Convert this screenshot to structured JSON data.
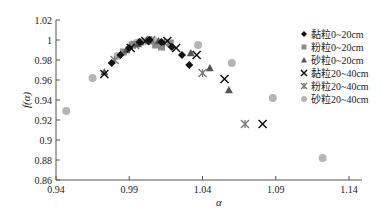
{
  "chart_data": {
    "type": "scatter",
    "title": "",
    "xlabel": "α",
    "ylabel": "f(α)",
    "xlim": [
      0.94,
      1.14
    ],
    "ylim": [
      0.86,
      1.02
    ],
    "xticks": [
      "0.94",
      "0.99",
      "1.04",
      "1.09",
      "1.14"
    ],
    "yticks": [
      "1.02",
      "1",
      "0.98",
      "0.96",
      "0.94",
      "0.92",
      "0.9",
      "0.88",
      "0.86"
    ],
    "grid": false,
    "legend_position": "right",
    "series": [
      {
        "name": "黏粒0~20cm",
        "marker": "diamond",
        "color": "#111111",
        "points": [
          [
            0.978,
            0.977
          ],
          [
            0.984,
            0.985
          ],
          [
            0.99,
            0.992
          ],
          [
            0.997,
            0.998
          ],
          [
            1.004,
            1.0
          ],
          [
            1.012,
            0.998
          ],
          [
            1.019,
            0.993
          ],
          [
            1.026,
            0.985
          ],
          [
            1.031,
            0.975
          ]
        ]
      },
      {
        "name": "粉粒0~20cm",
        "marker": "square",
        "color": "#8c8c8c",
        "points": [
          [
            0.986,
            0.988
          ],
          [
            0.992,
            0.995
          ],
          [
            0.998,
            0.998
          ],
          [
            1.003,
            0.999
          ],
          [
            1.008,
            0.995
          ],
          [
            1.012,
            0.993
          ],
          [
            1.018,
            0.997
          ]
        ]
      },
      {
        "name": "砂粒0~20cm",
        "marker": "triangle",
        "color": "#555555",
        "points": [
          [
            0.973,
            0.968
          ],
          [
            0.988,
            0.99
          ],
          [
            0.996,
            0.996
          ],
          [
            1.002,
            1.0
          ],
          [
            1.01,
            0.999
          ],
          [
            1.032,
            0.987
          ],
          [
            1.045,
            0.972
          ],
          [
            1.058,
            0.95
          ]
        ]
      },
      {
        "name": "黏粒20~40cm",
        "marker": "x",
        "color": "#111111",
        "points": [
          [
            0.973,
            0.966
          ],
          [
            0.991,
            0.992
          ],
          [
            1.001,
            0.999
          ],
          [
            1.016,
            0.999
          ],
          [
            1.022,
            0.992
          ],
          [
            1.036,
            0.985
          ],
          [
            1.055,
            0.961
          ],
          [
            1.081,
            0.916
          ]
        ]
      },
      {
        "name": "粉粒20~40cm",
        "marker": "star",
        "color": "#777777",
        "points": [
          [
            0.98,
            0.98
          ],
          [
            0.994,
            0.995
          ],
          [
            1.005,
            1.0
          ],
          [
            1.014,
            0.997
          ],
          [
            1.04,
            0.967
          ],
          [
            1.069,
            0.916
          ]
        ]
      },
      {
        "name": "砂粒20~40cm",
        "marker": "circle",
        "color": "#b5b5b5",
        "points": [
          [
            0.947,
            0.929
          ],
          [
            0.965,
            0.962
          ],
          [
            0.982,
            0.984
          ],
          [
            0.995,
            0.997
          ],
          [
            1.007,
            0.999
          ],
          [
            1.037,
            0.995
          ],
          [
            1.06,
            0.977
          ],
          [
            1.088,
            0.942
          ],
          [
            1.122,
            0.882
          ]
        ]
      }
    ]
  }
}
